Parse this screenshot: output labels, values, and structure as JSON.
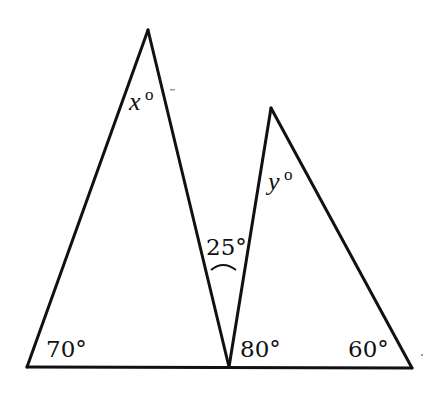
{
  "diagram": {
    "type": "geometry",
    "stroke_color": "#111111",
    "background": "#ffffff",
    "baseline": {
      "from": [
        27,
        367
      ],
      "to": [
        412,
        368
      ]
    },
    "triangles": [
      {
        "name": "left-triangle",
        "vertices": {
          "apex": [
            148,
            30
          ],
          "base_left": [
            27,
            367
          ],
          "base_right": [
            229,
            367
          ]
        }
      },
      {
        "name": "right-triangle",
        "vertices": {
          "apex": [
            271,
            108
          ],
          "base_left": [
            229,
            367
          ],
          "base_right": [
            412,
            368
          ]
        }
      }
    ],
    "labels": {
      "x_var": "x",
      "x_deg": "o",
      "y_var": "y",
      "y_deg": "o",
      "angle_between": "25°",
      "left_base_angle": "70°",
      "shared_vertex_angle": "80°",
      "right_base_angle": "60°"
    }
  }
}
